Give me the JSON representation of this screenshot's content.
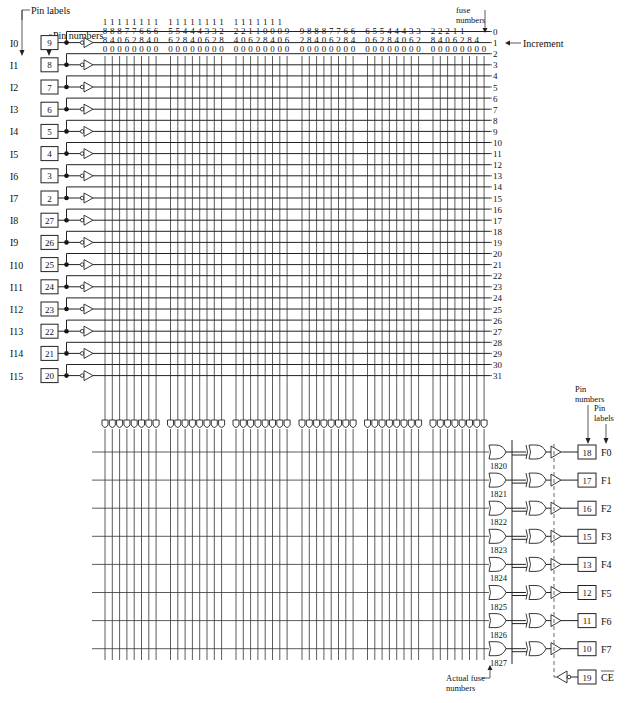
{
  "annotations": {
    "pin_labels_top": "Pin labels",
    "pin_numbers_top": "Pin numbers",
    "fuse_numbers_line1": "fuse",
    "fuse_numbers_line2": "numbers",
    "increment": "Increment",
    "pin_numbers_right_line1": "Pin",
    "pin_numbers_right_line2": "numbers",
    "pin_labels_right_line1": "Pin",
    "pin_labels_right_line2": "labels",
    "actual_fuse_line1": "Actual fuse",
    "actual_fuse_line2": "numbers"
  },
  "column_fuse_numbers": [
    [
      "1880",
      "1840",
      "1800",
      "1760",
      "1720",
      "1680",
      "1640",
      "1600"
    ],
    [
      "1560",
      "1520",
      "1480",
      "1440",
      "1400",
      "1360",
      "1320",
      "1280"
    ],
    [
      "1240",
      "1200",
      "1160",
      "1120",
      "1080",
      "1040",
      "1000",
      "960"
    ],
    [
      "920",
      "880",
      "840",
      "800",
      "760",
      "720",
      "680",
      "640"
    ],
    [
      "600",
      "560",
      "520",
      "480",
      "440",
      "400",
      "360",
      "320"
    ],
    [
      "280",
      "240",
      "200",
      "160",
      "120",
      "80",
      "40",
      "0"
    ]
  ],
  "row_numbers": [
    "0",
    "1",
    "2",
    "3",
    "4",
    "5",
    "6",
    "7",
    "8",
    "9",
    "10",
    "11",
    "12",
    "13",
    "14",
    "15",
    "16",
    "17",
    "18",
    "19",
    "20",
    "21",
    "22",
    "23",
    "24",
    "25",
    "26",
    "27",
    "28",
    "29",
    "30",
    "31"
  ],
  "inputs": [
    {
      "label": "I0",
      "pin": "9"
    },
    {
      "label": "I1",
      "pin": "8"
    },
    {
      "label": "I2",
      "pin": "7"
    },
    {
      "label": "I3",
      "pin": "6"
    },
    {
      "label": "I4",
      "pin": "5"
    },
    {
      "label": "I5",
      "pin": "4"
    },
    {
      "label": "I6",
      "pin": "3"
    },
    {
      "label": "I7",
      "pin": "2"
    },
    {
      "label": "I8",
      "pin": "27"
    },
    {
      "label": "I9",
      "pin": "26"
    },
    {
      "label": "I10",
      "pin": "25"
    },
    {
      "label": "I11",
      "pin": "24"
    },
    {
      "label": "I12",
      "pin": "23"
    },
    {
      "label": "I13",
      "pin": "22"
    },
    {
      "label": "I14",
      "pin": "21"
    },
    {
      "label": "I15",
      "pin": "20"
    }
  ],
  "outputs": [
    {
      "label": "F0",
      "pin": "18",
      "fuse": "1820"
    },
    {
      "label": "F1",
      "pin": "17",
      "fuse": "1821"
    },
    {
      "label": "F2",
      "pin": "16",
      "fuse": "1822"
    },
    {
      "label": "F3",
      "pin": "15",
      "fuse": "1823"
    },
    {
      "label": "F4",
      "pin": "13",
      "fuse": "1824"
    },
    {
      "label": "F5",
      "pin": "12",
      "fuse": "1825"
    },
    {
      "label": "F6",
      "pin": "11",
      "fuse": "1826"
    },
    {
      "label": "F7",
      "pin": "10",
      "fuse": "1827"
    }
  ],
  "enable": {
    "label": "CE",
    "pin": "19",
    "overbar": true
  }
}
